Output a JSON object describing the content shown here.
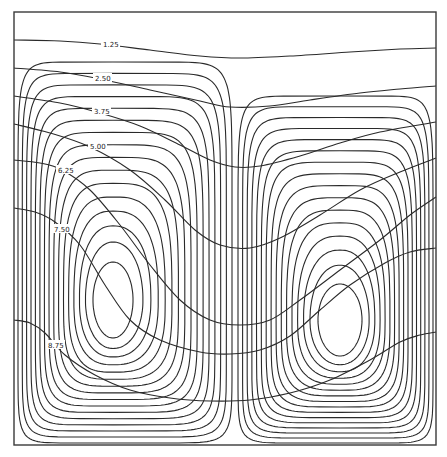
{
  "figure": {
    "width": 447,
    "height": 457,
    "background": "#ffffff",
    "line_color": "#2a2a2a",
    "frame": {
      "x0": 14,
      "y0": 12,
      "x1": 436,
      "y1": 445
    }
  },
  "chart_data": {
    "type": "contour",
    "title": "",
    "isotherm_levels": [
      "1.25",
      "2.50",
      "3.75",
      "5.00",
      "6.25",
      "7.50",
      "8.75"
    ],
    "isotherms": [
      {
        "label": "1.25",
        "points": [
          [
            14,
            40
          ],
          [
            60,
            41
          ],
          [
            100,
            44
          ],
          [
            150,
            50
          ],
          [
            200,
            56
          ],
          [
            240,
            58
          ],
          [
            290,
            56
          ],
          [
            350,
            52
          ],
          [
            400,
            49
          ],
          [
            436,
            48
          ]
        ],
        "label_at": [
          103,
          44
        ]
      },
      {
        "label": "2.50",
        "points": [
          [
            14,
            68
          ],
          [
            60,
            72
          ],
          [
            100,
            79
          ],
          [
            150,
            90
          ],
          [
            200,
            101
          ],
          [
            230,
            107
          ],
          [
            270,
            106
          ],
          [
            310,
            100
          ],
          [
            360,
            93
          ],
          [
            400,
            89
          ],
          [
            436,
            86
          ]
        ],
        "label_at": [
          95,
          78
        ]
      },
      {
        "label": "3.75",
        "points": [
          [
            14,
            96
          ],
          [
            60,
            103
          ],
          [
            100,
            113
          ],
          [
            140,
            126
          ],
          [
            180,
            145
          ],
          [
            210,
            160
          ],
          [
            235,
            167
          ],
          [
            260,
            166
          ],
          [
            300,
            156
          ],
          [
            340,
            143
          ],
          [
            380,
            132
          ],
          [
            436,
            122
          ]
        ],
        "label_at": [
          94,
          111
        ]
      },
      {
        "label": "5.00",
        "points": [
          [
            14,
            124
          ],
          [
            50,
            133
          ],
          [
            90,
            147
          ],
          [
            130,
            170
          ],
          [
            165,
            200
          ],
          [
            195,
            230
          ],
          [
            220,
            245
          ],
          [
            250,
            248
          ],
          [
            280,
            238
          ],
          [
            320,
            215
          ],
          [
            360,
            190
          ],
          [
            400,
            172
          ],
          [
            436,
            158
          ]
        ],
        "label_at": [
          90,
          146
        ]
      },
      {
        "label": "6.25",
        "points": [
          [
            14,
            160
          ],
          [
            40,
            163
          ],
          [
            62,
            170
          ],
          [
            90,
            190
          ],
          [
            120,
            225
          ],
          [
            150,
            265
          ],
          [
            180,
            300
          ],
          [
            210,
            320
          ],
          [
            240,
            325
          ],
          [
            270,
            320
          ],
          [
            300,
            300
          ],
          [
            340,
            270
          ],
          [
            380,
            240
          ],
          [
            410,
            215
          ],
          [
            436,
            197
          ]
        ],
        "label_at": [
          58,
          170
        ]
      },
      {
        "label": "7.50",
        "points": [
          [
            14,
            208
          ],
          [
            35,
            212
          ],
          [
            55,
            222
          ],
          [
            80,
            245
          ],
          [
            105,
            285
          ],
          [
            130,
            320
          ],
          [
            160,
            340
          ],
          [
            200,
            352
          ],
          [
            230,
            354
          ],
          [
            260,
            350
          ],
          [
            290,
            336
          ],
          [
            320,
            310
          ],
          [
            350,
            285
          ],
          [
            385,
            263
          ],
          [
            410,
            252
          ],
          [
            436,
            248
          ]
        ],
        "label_at": [
          54,
          229
        ]
      },
      {
        "label": "8.75",
        "points": [
          [
            14,
            320
          ],
          [
            30,
            323
          ],
          [
            45,
            333
          ],
          [
            65,
            355
          ],
          [
            95,
            375
          ],
          [
            130,
            390
          ],
          [
            170,
            398
          ],
          [
            210,
            401
          ],
          [
            250,
            400
          ],
          [
            290,
            393
          ],
          [
            330,
            380
          ],
          [
            370,
            360
          ],
          [
            400,
            342
          ],
          [
            420,
            335
          ],
          [
            436,
            332
          ]
        ],
        "label_at": [
          48,
          345
        ]
      }
    ],
    "streamline_cells": [
      {
        "name": "left-cell",
        "center": [
          113,
          300
        ],
        "inner_rx": 20,
        "inner_ry": 38,
        "outer": {
          "left": 18,
          "right": 232,
          "top": 62,
          "bottom": 443
        },
        "levels": 16
      },
      {
        "name": "right-cell",
        "center": [
          340,
          320
        ],
        "inner_rx": 22,
        "inner_ry": 36,
        "outer": {
          "left": 238,
          "right": 433,
          "top": 96,
          "bottom": 443
        },
        "levels": 16
      }
    ],
    "xlabel": "",
    "ylabel": "",
    "grid": false,
    "legend": null
  }
}
